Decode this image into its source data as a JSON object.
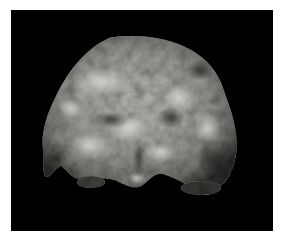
{
  "image": {
    "description": "Grayscale 3D volume-rendered image of a rounded, lumpy tissue mass on a black background",
    "background_color": "#000000",
    "border_color": "#ffffff",
    "subject_tone_light": "#c8c8c4",
    "subject_tone_mid": "#8e8e8a",
    "subject_tone_dark": "#3a3a38"
  }
}
